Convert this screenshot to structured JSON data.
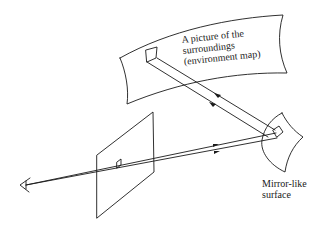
{
  "diagram": {
    "labels": {
      "environment_map": [
        "A picture of the",
        "surroundings",
        "(environment map)"
      ],
      "mirror": [
        "Mirror-like",
        "surface"
      ]
    },
    "elements": [
      "eye",
      "image-plane",
      "pixel",
      "mirror-surface",
      "environment-map"
    ],
    "stroke_color": "#1a1a1a",
    "background": "#ffffff"
  }
}
